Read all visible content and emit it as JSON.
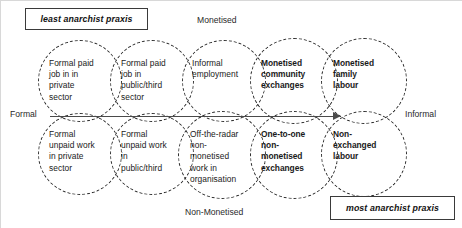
{
  "diagram": {
    "title_box_left": "least anarchist praxis",
    "title_box_right": "most anarchist praxis",
    "axis": {
      "top": "Monetised",
      "bottom": "Non-Monetised",
      "left": "Formal",
      "right": "Informal"
    },
    "cells": {
      "top": [
        {
          "label": "Formal paid\njob in in\nprivate\nsector",
          "bold": false
        },
        {
          "label": "Formal paid\njob in\npublic/third\nsector",
          "bold": false
        },
        {
          "label": "Informal\nemployment",
          "bold": false
        },
        {
          "label": "Monetised\ncommunity\nexchanges",
          "bold": true
        },
        {
          "label": "Monetised\nfamily\nlabour",
          "bold": true
        }
      ],
      "bottom": [
        {
          "label": "Formal\nunpaid work\nin private\nsector",
          "bold": false
        },
        {
          "label": "Formal\nunpaid work\nin\npublic/third",
          "bold": false
        },
        {
          "label": "Off-the-radar\nnon-\nmonetised\nwork in\norganisation",
          "bold": false
        },
        {
          "label": "One-to-one\nnon-\nmonetised\nexchanges",
          "bold": true
        },
        {
          "label": "Non-\nexchanged\nlabour",
          "bold": true
        }
      ]
    },
    "colors": {
      "stroke": "#2b2b2b",
      "axis": "#4a4a4a",
      "text": "#1a1a1a",
      "background": "#ffffff"
    }
  }
}
